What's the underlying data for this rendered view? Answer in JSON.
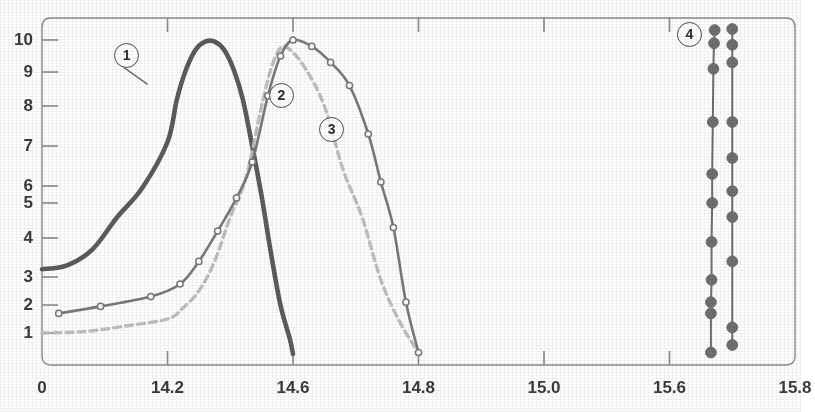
{
  "chart_data": {
    "type": "line",
    "title": "",
    "subtitle": "",
    "xlabel": "",
    "ylabel": "",
    "grid": false,
    "legend_position": "inline-callouts",
    "xlim": [
      14.05,
      15.8
    ],
    "ylim": [
      0.3,
      10.55
    ],
    "y_scale": "nonlinear-probability",
    "x_tick_labels": [
      "0",
      "14.2",
      "14.6",
      "14.8",
      "15.0",
      "15.6",
      "15.8"
    ],
    "x_tick_values": [
      14.05,
      14.2,
      14.6,
      14.8,
      15.0,
      15.6,
      15.8
    ],
    "y_tick_labels": [
      "10",
      "9",
      "8",
      "7",
      "6",
      "5",
      "4",
      "3",
      "2",
      "1"
    ],
    "y_tick_values": [
      10,
      9,
      8,
      7,
      6,
      5,
      4,
      3,
      2,
      1
    ],
    "annotations": [
      {
        "label": "1",
        "x": 14.15,
        "y": 9.55,
        "note": "callout pointing to dark solid curve"
      },
      {
        "label": "2",
        "x": 14.56,
        "y": 8.35,
        "note": "callout for light dashed curve"
      },
      {
        "label": "3",
        "x": 14.66,
        "y": 7.45,
        "note": "callout for marker curve"
      },
      {
        "label": "4",
        "x": 15.63,
        "y": 10.3,
        "note": "callout for vertical marker lines"
      }
    ],
    "series": [
      {
        "name": "1",
        "style": "solid-thick",
        "color": "#5c5c5c",
        "markers": "none",
        "x": [
          14.05,
          14.08,
          14.11,
          14.14,
          14.17,
          14.2,
          14.23,
          14.26,
          14.29,
          14.32,
          14.35,
          14.38,
          14.41,
          14.44,
          14.47,
          14.5,
          14.53,
          14.56,
          14.59,
          14.6
        ],
        "y": [
          3.2,
          3.3,
          3.7,
          4.6,
          5.9,
          7.1,
          8.2,
          9.1,
          9.7,
          9.95,
          9.95,
          9.7,
          9.1,
          8.2,
          7.0,
          5.4,
          3.6,
          2.0,
          0.8,
          0.3
        ]
      },
      {
        "name": "2",
        "style": "dashed",
        "color": "#bdbdbd",
        "markers": "none",
        "x": [
          14.05,
          14.1,
          14.15,
          14.2,
          14.25,
          14.3,
          14.35,
          14.4,
          14.45,
          14.5,
          14.53,
          14.56,
          14.59,
          14.62,
          14.65,
          14.68,
          14.71,
          14.74,
          14.77,
          14.8
        ],
        "y": [
          1.0,
          1.05,
          1.25,
          1.5,
          1.9,
          2.5,
          3.4,
          4.6,
          6.2,
          8.0,
          9.1,
          9.75,
          9.7,
          9.1,
          8.0,
          6.4,
          4.6,
          2.9,
          1.4,
          0.35
        ]
      },
      {
        "name": "3",
        "style": "solid-markers",
        "color": "#7a7a7a",
        "markers": "open-circle",
        "x": [
          14.07,
          14.12,
          14.18,
          14.24,
          14.3,
          14.36,
          14.42,
          14.47,
          14.52,
          14.56,
          14.6,
          14.63,
          14.66,
          14.69,
          14.72,
          14.74,
          14.76,
          14.78,
          14.8
        ],
        "y": [
          1.7,
          1.95,
          2.3,
          2.75,
          3.4,
          4.2,
          5.3,
          6.6,
          8.3,
          9.5,
          10.0,
          9.8,
          9.3,
          8.6,
          7.3,
          6.1,
          4.3,
          2.1,
          0.35
        ]
      },
      {
        "name": "4a",
        "style": "solid-filled-markers",
        "color": "#6f6f6f",
        "markers": "filled-circle",
        "x": [
          15.672,
          15.671,
          15.67,
          15.669,
          15.668,
          15.668,
          15.667,
          15.667,
          15.666,
          15.666,
          15.666
        ],
        "y": [
          10.45,
          9.9,
          9.1,
          7.6,
          6.3,
          5.0,
          3.9,
          2.9,
          2.1,
          1.7,
          0.35
        ]
      },
      {
        "name": "4b",
        "style": "solid-filled-markers",
        "color": "#6f6f6f",
        "markers": "filled-circle",
        "x": [
          15.7,
          15.7,
          15.7,
          15.7,
          15.7,
          15.7,
          15.7,
          15.7,
          15.7,
          15.7
        ],
        "y": [
          10.5,
          9.85,
          9.3,
          7.6,
          6.7,
          5.7,
          4.6,
          3.4,
          1.2,
          0.6
        ]
      }
    ]
  },
  "axes": {
    "y_ticks": [
      {
        "label": "10",
        "value": 10
      },
      {
        "label": "9",
        "value": 9
      },
      {
        "label": "8",
        "value": 8
      },
      {
        "label": "7",
        "value": 7
      },
      {
        "label": "6",
        "value": 6
      },
      {
        "label": "5",
        "value": 5
      },
      {
        "label": "4",
        "value": 4
      },
      {
        "label": "3",
        "value": 3
      },
      {
        "label": "2",
        "value": 2
      },
      {
        "label": "1",
        "value": 1
      }
    ],
    "x_ticks": [
      {
        "label": "0",
        "value": 14.05
      },
      {
        "label": "14.2",
        "value": 14.2
      },
      {
        "label": "14.6",
        "value": 14.6
      },
      {
        "label": "14.8",
        "value": 14.8
      },
      {
        "label": "15.0",
        "value": 15.0
      },
      {
        "label": "15.6",
        "value": 15.6
      },
      {
        "label": "15.8",
        "value": 15.8
      }
    ]
  },
  "callouts": [
    {
      "label": "1"
    },
    {
      "label": "2"
    },
    {
      "label": "3"
    },
    {
      "label": "4"
    }
  ],
  "colors": {
    "axis": "#8a8a8a",
    "text": "#3b3b3b",
    "series1": "#5c5c5c",
    "series2": "#bdbdbd",
    "series3": "#7a7a7a",
    "series4": "#6f6f6f",
    "background": "#fefefe"
  }
}
